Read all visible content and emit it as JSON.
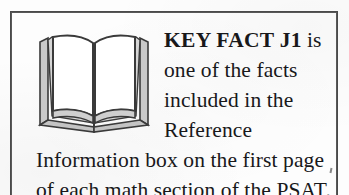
{
  "callout": {
    "kind": "key-fact-callout",
    "lead_label": "KEY FACT J1",
    "body_text": "is one of the facts included in the Reference Information box on the first page of each math section of the PSAT.",
    "full_text": "KEY FACT J1 is one of the facts included in the Reference Information box on the first page of each math section of the PSAT.",
    "icon_name": "open-book-icon",
    "icon_alt": "open book",
    "border_color": "#4a4a4a",
    "text_color": "#18181a",
    "page_color": "#fdfdfd",
    "book_shade_color": "#cfcfcf",
    "book_outline_color": "#3a3a3a"
  }
}
